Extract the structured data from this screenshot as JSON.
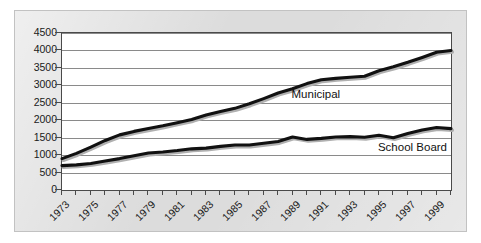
{
  "chart_data": {
    "type": "line",
    "title": "",
    "subtitle": "",
    "xlabel": "",
    "ylabel": "",
    "xlim": [
      1973,
      2000
    ],
    "ylim": [
      0,
      4500
    ],
    "ytick_step": 500,
    "yticks": [
      "0",
      "500",
      "1000",
      "1500",
      "2000",
      "2500",
      "3000",
      "3500",
      "4000",
      "4500"
    ],
    "xticks": [
      "1973",
      "1975",
      "1977",
      "1979",
      "1981",
      "1983",
      "1985",
      "1987",
      "1989",
      "1991",
      "1993",
      "1995",
      "1997",
      "1999"
    ],
    "xtick_step": 2,
    "grid": "horizontal",
    "legend_position": "inline-annotation",
    "line_color": "#111111",
    "grid_color": "#8a8a8a",
    "plot_background": "#ffffff",
    "panel_background": "#dcdcdc",
    "x": [
      1973,
      1974,
      1975,
      1976,
      1977,
      1978,
      1979,
      1980,
      1981,
      1982,
      1983,
      1984,
      1985,
      1986,
      1987,
      1988,
      1989,
      1990,
      1991,
      1992,
      1993,
      1994,
      1995,
      1996,
      1997,
      1998,
      1999,
      2000
    ],
    "series": [
      {
        "name": "Municipal",
        "values": [
          900,
          1050,
          1230,
          1420,
          1580,
          1680,
          1760,
          1840,
          1930,
          2020,
          2150,
          2250,
          2340,
          2470,
          2620,
          2780,
          2900,
          3050,
          3160,
          3200,
          3230,
          3260,
          3420,
          3530,
          3660,
          3800,
          3950,
          4000
        ]
      },
      {
        "name": "School Board",
        "values": [
          700,
          720,
          760,
          830,
          900,
          980,
          1060,
          1090,
          1130,
          1180,
          1200,
          1250,
          1290,
          1290,
          1340,
          1390,
          1520,
          1450,
          1480,
          1520,
          1530,
          1510,
          1570,
          1500,
          1620,
          1720,
          1790,
          1760
        ]
      }
    ],
    "annotations": [
      {
        "text": "Municipal",
        "x": 1989,
        "y": 2700
      },
      {
        "text": "School Board",
        "x": 1995,
        "y": 1180
      }
    ]
  }
}
